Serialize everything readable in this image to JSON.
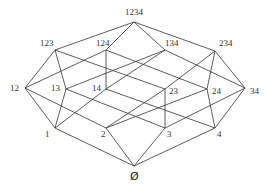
{
  "diagram": {
    "nodes": [
      {
        "id": "1234",
        "label": "1234",
        "x": 134,
        "y": 22,
        "lx": 125,
        "ly": 15
      },
      {
        "id": "123",
        "label": "123",
        "x": 55,
        "y": 50,
        "lx": 40,
        "ly": 46
      },
      {
        "id": "124",
        "label": "124",
        "x": 106,
        "y": 50,
        "lx": 96,
        "ly": 46
      },
      {
        "id": "134",
        "label": "134",
        "x": 165,
        "y": 50,
        "lx": 165,
        "ly": 46
      },
      {
        "id": "234",
        "label": "234",
        "x": 215,
        "y": 51,
        "lx": 219,
        "ly": 46
      },
      {
        "id": "12",
        "label": "12",
        "x": 25,
        "y": 88,
        "lx": 10,
        "ly": 91
      },
      {
        "id": "13",
        "label": "13",
        "x": 66,
        "y": 89,
        "lx": 51,
        "ly": 91
      },
      {
        "id": "14",
        "label": "14",
        "x": 106,
        "y": 89,
        "lx": 92,
        "ly": 91
      },
      {
        "id": "23",
        "label": "23",
        "x": 165,
        "y": 89,
        "lx": 169,
        "ly": 94
      },
      {
        "id": "24",
        "label": "24",
        "x": 207,
        "y": 89,
        "lx": 212,
        "ly": 94
      },
      {
        "id": "34",
        "label": "34",
        "x": 245,
        "y": 88,
        "lx": 250,
        "ly": 94
      },
      {
        "id": "1",
        "label": "1",
        "x": 55,
        "y": 128,
        "lx": 45,
        "ly": 137
      },
      {
        "id": "2",
        "label": "2",
        "x": 106,
        "y": 128,
        "lx": 101,
        "ly": 137
      },
      {
        "id": "3",
        "label": "3",
        "x": 165,
        "y": 128,
        "lx": 167,
        "ly": 137
      },
      {
        "id": "4",
        "label": "4",
        "x": 215,
        "y": 128,
        "lx": 217,
        "ly": 137
      },
      {
        "id": "empty",
        "label": "Ø",
        "x": 134,
        "y": 166,
        "lx": 130,
        "ly": 180
      }
    ],
    "edges": [
      [
        "1234",
        "123"
      ],
      [
        "1234",
        "124"
      ],
      [
        "1234",
        "134"
      ],
      [
        "1234",
        "234"
      ],
      [
        "123",
        "12"
      ],
      [
        "123",
        "13"
      ],
      [
        "123",
        "23"
      ],
      [
        "124",
        "12"
      ],
      [
        "124",
        "14"
      ],
      [
        "124",
        "24"
      ],
      [
        "134",
        "13"
      ],
      [
        "134",
        "14"
      ],
      [
        "134",
        "34"
      ],
      [
        "234",
        "23"
      ],
      [
        "234",
        "24"
      ],
      [
        "234",
        "34"
      ],
      [
        "12",
        "1"
      ],
      [
        "12",
        "2"
      ],
      [
        "13",
        "1"
      ],
      [
        "13",
        "3"
      ],
      [
        "14",
        "1"
      ],
      [
        "14",
        "4"
      ],
      [
        "23",
        "2"
      ],
      [
        "23",
        "3"
      ],
      [
        "24",
        "2"
      ],
      [
        "24",
        "4"
      ],
      [
        "34",
        "3"
      ],
      [
        "34",
        "4"
      ],
      [
        "1",
        "empty"
      ],
      [
        "2",
        "empty"
      ],
      [
        "3",
        "empty"
      ],
      [
        "4",
        "empty"
      ]
    ],
    "colors": {
      "line": "#333333",
      "text": "#333333",
      "background": "#ffffff"
    }
  }
}
